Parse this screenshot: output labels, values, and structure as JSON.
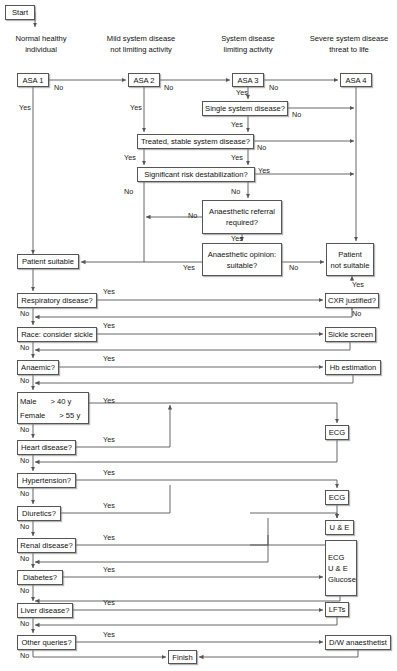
{
  "diagram": {
    "type": "flowchart",
    "canvas": {
      "width": 397,
      "height": 671
    },
    "style": {
      "box_border": "#555555",
      "box_fill": "#ffffff",
      "line": "#555555",
      "text": "#111111"
    }
  },
  "column_headers": [
    {
      "id": "h1",
      "lines": [
        "Normal healthy",
        "individual"
      ],
      "x": 5,
      "y": 33,
      "w": 72
    },
    {
      "id": "h2",
      "lines": [
        "Mild system disease",
        "not limiting activity"
      ],
      "x": 98,
      "y": 33,
      "w": 86
    },
    {
      "id": "h3",
      "lines": [
        "System disease",
        "limiting activity"
      ],
      "x": 212,
      "y": 33,
      "w": 72
    },
    {
      "id": "h4",
      "lines": [
        "Severe system disease",
        "threat to life"
      ],
      "x": 303,
      "y": 33,
      "w": 92
    }
  ],
  "nodes": [
    {
      "id": "start",
      "label": "Start",
      "x": 5,
      "y": 5,
      "w": 30,
      "h": 15
    },
    {
      "id": "asa1",
      "label": "ASA 1",
      "x": 17,
      "y": 73,
      "w": 32,
      "h": 14
    },
    {
      "id": "asa2",
      "label": "ASA 2",
      "x": 128,
      "y": 73,
      "w": 32,
      "h": 14
    },
    {
      "id": "asa3",
      "label": "ASA 3",
      "x": 232,
      "y": 73,
      "w": 32,
      "h": 14
    },
    {
      "id": "asa4",
      "label": "ASA 4",
      "x": 340,
      "y": 73,
      "w": 32,
      "h": 14
    },
    {
      "id": "single",
      "label": "Single system disease?",
      "x": 202,
      "y": 101,
      "w": 86,
      "h": 15
    },
    {
      "id": "treated",
      "label": "Treated, stable system disease?",
      "x": 137,
      "y": 134,
      "w": 117,
      "h": 15
    },
    {
      "id": "signif",
      "label": "Significant risk destabilization?",
      "x": 137,
      "y": 167,
      "w": 118,
      "h": 15
    },
    {
      "id": "referral",
      "lines": [
        "Anaesthetic referral",
        "required?"
      ],
      "x": 202,
      "y": 200,
      "w": 80,
      "h": 34
    },
    {
      "id": "opinion",
      "lines": [
        "Anaesthetic opinion:",
        "suitable?"
      ],
      "x": 202,
      "y": 243,
      "w": 80,
      "h": 33
    },
    {
      "id": "suitable",
      "label": "Patient suitable",
      "x": 17,
      "y": 254,
      "w": 62,
      "h": 15
    },
    {
      "id": "notsuitable",
      "lines": [
        "Patient",
        "not suitable"
      ],
      "x": 326,
      "y": 243,
      "w": 48,
      "h": 33
    },
    {
      "id": "resp",
      "label": "Respiratory disease?",
      "x": 17,
      "y": 293,
      "w": 80,
      "h": 15
    },
    {
      "id": "cxr",
      "label": "CXR justified?",
      "x": 325,
      "y": 293,
      "w": 54,
      "h": 15
    },
    {
      "id": "race",
      "label": "Race: consider sickle",
      "x": 17,
      "y": 327,
      "w": 80,
      "h": 15
    },
    {
      "id": "sickle",
      "label": "Sickle screen",
      "x": 325,
      "y": 327,
      "w": 51,
      "h": 15
    },
    {
      "id": "anaemic",
      "label": "Anaemic?",
      "x": 17,
      "y": 360,
      "w": 42,
      "h": 15
    },
    {
      "id": "hb",
      "label": "Hb estimation",
      "x": 325,
      "y": 360,
      "w": 56,
      "h": 15
    },
    {
      "id": "age",
      "rows": [
        [
          "Male",
          "> 40 y"
        ],
        [
          "Female",
          "> 55 y"
        ]
      ],
      "x": 17,
      "y": 392,
      "w": 72,
      "h": 32
    },
    {
      "id": "ecg1",
      "label": "ECG",
      "x": 325,
      "y": 425,
      "w": 24,
      "h": 15
    },
    {
      "id": "heart",
      "label": "Heart disease?",
      "x": 17,
      "y": 440,
      "w": 59,
      "h": 15
    },
    {
      "id": "hyper",
      "label": "Hypertension?",
      "x": 17,
      "y": 473,
      "w": 59,
      "h": 15
    },
    {
      "id": "ecg2",
      "label": "ECG",
      "x": 325,
      "y": 490,
      "w": 24,
      "h": 15
    },
    {
      "id": "diuretics",
      "label": "Diuretics?",
      "x": 17,
      "y": 506,
      "w": 44,
      "h": 15
    },
    {
      "id": "ue",
      "label": "U & E",
      "x": 325,
      "y": 520,
      "w": 29,
      "h": 15
    },
    {
      "id": "renal",
      "label": "Renal disease?",
      "x": 17,
      "y": 538,
      "w": 59,
      "h": 15
    },
    {
      "id": "diabpanel",
      "lines": [
        "ECG",
        "U & E",
        "Glucose"
      ],
      "x": 325,
      "y": 540,
      "w": 32,
      "h": 56,
      "align": "left"
    },
    {
      "id": "diabetes",
      "label": "Diabetes?",
      "x": 17,
      "y": 570,
      "w": 46,
      "h": 15
    },
    {
      "id": "liver",
      "label": "Liver disease?",
      "x": 17,
      "y": 603,
      "w": 56,
      "h": 15
    },
    {
      "id": "lfts",
      "label": "LFTs",
      "x": 325,
      "y": 602,
      "w": 24,
      "h": 15
    },
    {
      "id": "other",
      "label": "Other queries?",
      "x": 17,
      "y": 635,
      "w": 59,
      "h": 15
    },
    {
      "id": "dw",
      "label": "D/W anaesthetist",
      "x": 325,
      "y": 635,
      "w": 66,
      "h": 15
    },
    {
      "id": "finish",
      "label": "Finish",
      "x": 168,
      "y": 650,
      "w": 29,
      "h": 14
    }
  ],
  "edge_labels": [
    {
      "id": "e1",
      "text": "No",
      "x": 54,
      "y": 84
    },
    {
      "id": "e2",
      "text": "No",
      "x": 164,
      "y": 84
    },
    {
      "id": "e3",
      "text": "No",
      "x": 269,
      "y": 84
    },
    {
      "id": "e4",
      "text": "Yes",
      "x": 19,
      "y": 104
    },
    {
      "id": "e5",
      "text": "Yes",
      "x": 130,
      "y": 104
    },
    {
      "id": "e6",
      "text": "Yes",
      "x": 236,
      "y": 89
    },
    {
      "id": "e7",
      "text": "No",
      "x": 292,
      "y": 111
    },
    {
      "id": "e8",
      "text": "Yes",
      "x": 231,
      "y": 121
    },
    {
      "id": "e9",
      "text": "No",
      "x": 257,
      "y": 144
    },
    {
      "id": "e10",
      "text": "Yes",
      "x": 124,
      "y": 154
    },
    {
      "id": "e11",
      "text": "Yes",
      "x": 231,
      "y": 154
    },
    {
      "id": "e12",
      "text": "Yes",
      "x": 258,
      "y": 167
    },
    {
      "id": "e13",
      "text": "No",
      "x": 124,
      "y": 188
    },
    {
      "id": "e14",
      "text": "No",
      "x": 231,
      "y": 188
    },
    {
      "id": "e15",
      "text": "No",
      "x": 188,
      "y": 212
    },
    {
      "id": "e16",
      "text": "Yes",
      "x": 231,
      "y": 235
    },
    {
      "id": "e17",
      "text": "Yes",
      "x": 183,
      "y": 264
    },
    {
      "id": "e18",
      "text": "No",
      "x": 289,
      "y": 264
    },
    {
      "id": "e19",
      "text": "Yes",
      "x": 352,
      "y": 281
    },
    {
      "id": "e20",
      "text": "Yes",
      "x": 103,
      "y": 288
    },
    {
      "id": "e21",
      "text": "No",
      "x": 20,
      "y": 310
    },
    {
      "id": "e22",
      "text": "No",
      "x": 352,
      "y": 310
    },
    {
      "id": "e23",
      "text": "Yes",
      "x": 103,
      "y": 322
    },
    {
      "id": "e24",
      "text": "No",
      "x": 20,
      "y": 344
    },
    {
      "id": "e25",
      "text": "Yes",
      "x": 103,
      "y": 355
    },
    {
      "id": "e26",
      "text": "No",
      "x": 20,
      "y": 377
    },
    {
      "id": "e27",
      "text": "Yes",
      "x": 103,
      "y": 397
    },
    {
      "id": "e28",
      "text": "No",
      "x": 20,
      "y": 426
    },
    {
      "id": "e29",
      "text": "Yes",
      "x": 103,
      "y": 436
    },
    {
      "id": "e30",
      "text": "No",
      "x": 20,
      "y": 457
    },
    {
      "id": "e31",
      "text": "Yes",
      "x": 103,
      "y": 469
    },
    {
      "id": "e32",
      "text": "No",
      "x": 20,
      "y": 490
    },
    {
      "id": "e33",
      "text": "Yes",
      "x": 103,
      "y": 502
    },
    {
      "id": "e34",
      "text": "No",
      "x": 20,
      "y": 523
    },
    {
      "id": "e35",
      "text": "Yes",
      "x": 103,
      "y": 534
    },
    {
      "id": "e36",
      "text": "No",
      "x": 20,
      "y": 555
    },
    {
      "id": "e37",
      "text": "Yes",
      "x": 103,
      "y": 566
    },
    {
      "id": "e38",
      "text": "No",
      "x": 20,
      "y": 587
    },
    {
      "id": "e39",
      "text": "Yes",
      "x": 103,
      "y": 599
    },
    {
      "id": "e40",
      "text": "No",
      "x": 20,
      "y": 620
    },
    {
      "id": "e41",
      "text": "Yes",
      "x": 103,
      "y": 631
    },
    {
      "id": "e42",
      "text": "No",
      "x": 20,
      "y": 652
    }
  ],
  "edges": [
    {
      "id": "start-arrow",
      "d": "M 30 12 H 35 V 27",
      "arrow": "end"
    },
    {
      "id": "asa1-asa2",
      "d": "M 49 80 H 126",
      "arrow": "end"
    },
    {
      "id": "asa2-asa3",
      "d": "M 160 80 H 230",
      "arrow": "end"
    },
    {
      "id": "asa3-asa4",
      "d": "M 264 80 H 338",
      "arrow": "end"
    },
    {
      "id": "asa1-down",
      "d": "M 33 87 V 254",
      "arrow": "end"
    },
    {
      "id": "asa2-down",
      "d": "M 144 87 V 132",
      "arrow": "end"
    },
    {
      "id": "asa3-single",
      "d": "M 248 87 V 99",
      "arrow": "end"
    },
    {
      "id": "asa4-down",
      "d": "M 356 87 V 241",
      "arrow": "end"
    },
    {
      "id": "single-no",
      "d": "M 288 108 H 354",
      "arrow": "end"
    },
    {
      "id": "single-yes",
      "d": "M 248 116 V 132",
      "arrow": "end"
    },
    {
      "id": "treated-no",
      "d": "M 254 141 H 354",
      "arrow": "end"
    },
    {
      "id": "treated-yesL",
      "d": "M 144 149 V 165",
      "arrow": "end"
    },
    {
      "id": "treated-yesR",
      "d": "M 248 149 V 165",
      "arrow": "end"
    },
    {
      "id": "signif-yes",
      "d": "M 255 174 H 354",
      "arrow": "end"
    },
    {
      "id": "signif-noL",
      "d": "M 144 182 V 262",
      "arrow": "none"
    },
    {
      "id": "signif-noR",
      "d": "M 248 182 V 198",
      "arrow": "end"
    },
    {
      "id": "referral-no",
      "d": "M 202 217 H 146",
      "arrow": "end"
    },
    {
      "id": "referral-yes",
      "d": "M 242 234 V 241",
      "arrow": "end"
    },
    {
      "id": "opinion-yes",
      "d": "M 202 262 H 81",
      "arrow": "end"
    },
    {
      "id": "opinion-no",
      "d": "M 282 262 H 324",
      "arrow": "end"
    },
    {
      "id": "suit-down",
      "d": "M 33 269 V 291",
      "arrow": "end"
    },
    {
      "id": "resp-yes",
      "d": "M 97 300 H 323",
      "arrow": "end"
    },
    {
      "id": "cxr-yes",
      "d": "M 352 310 V 293",
      "arrow": "none"
    },
    {
      "id": "cxr-up",
      "d": "M 352 281 V 276",
      "arrow": "end"
    },
    {
      "id": "cxr-no",
      "d": "M 352 308 V 317 H 35",
      "arrow": "end"
    },
    {
      "id": "resp-no",
      "d": "M 33 308 V 325",
      "arrow": "end"
    },
    {
      "id": "race-yes",
      "d": "M 97 334 H 323",
      "arrow": "end"
    },
    {
      "id": "sickle-no",
      "d": "M 350 342 V 350 H 35",
      "arrow": "end"
    },
    {
      "id": "race-no",
      "d": "M 33 342 V 358",
      "arrow": "end"
    },
    {
      "id": "anaemic-yes",
      "d": "M 59 367 H 323",
      "arrow": "end"
    },
    {
      "id": "hb-no",
      "d": "M 353 375 V 383 H 35",
      "arrow": "end"
    },
    {
      "id": "anaemic-no",
      "d": "M 33 375 V 390",
      "arrow": "end"
    },
    {
      "id": "age-yes",
      "d": "M 89 403 H 337 V 423",
      "arrow": "end"
    },
    {
      "id": "age-no",
      "d": "M 33 424 V 438",
      "arrow": "end"
    },
    {
      "id": "heart-yes",
      "d": "M 76 447 H 170 V 405",
      "arrow": "end"
    },
    {
      "id": "ecg1-no",
      "d": "M 337 440 V 462 H 35",
      "arrow": "end"
    },
    {
      "id": "heart-no",
      "d": "M 33 455 V 471",
      "arrow": "end"
    },
    {
      "id": "hyper-yes",
      "d": "M 76 480 H 337 V 488",
      "arrow": "end"
    },
    {
      "id": "hyper-no",
      "d": "M 33 488 V 504",
      "arrow": "end"
    },
    {
      "id": "diur-yes",
      "d": "M 61 513 H 170 V 485",
      "arrow": "none"
    },
    {
      "id": "diur-ue",
      "d": "M 250 513 H 337 V 518",
      "arrow": "end"
    },
    {
      "id": "ecg2-ue",
      "d": "M 337 505 V 518",
      "arrow": "end"
    },
    {
      "id": "diur-no",
      "d": "M 33 521 V 536",
      "arrow": "end"
    },
    {
      "id": "renal-yes",
      "d": "M 76 545 H 268 V 518",
      "arrow": "none"
    },
    {
      "id": "renal-yes2",
      "d": "M 250 545 H 337",
      "arrow": "none"
    },
    {
      "id": "ue-back",
      "d": "M 268 535 V 562 H 35",
      "arrow": "end"
    },
    {
      "id": "renal-no",
      "d": "M 33 553 V 568",
      "arrow": "end"
    },
    {
      "id": "diab-yes",
      "d": "M 63 577 H 323",
      "arrow": "end"
    },
    {
      "id": "diabp-no",
      "d": "M 340 596 V 601 H 35",
      "arrow": "end"
    },
    {
      "id": "diab-no",
      "d": "M 33 585 V 601",
      "arrow": "end"
    },
    {
      "id": "liver-yes",
      "d": "M 73 610 H 323",
      "arrow": "end"
    },
    {
      "id": "lfts-no",
      "d": "M 337 617 V 625 H 35",
      "arrow": "end"
    },
    {
      "id": "liver-no",
      "d": "M 33 618 V 633",
      "arrow": "end"
    },
    {
      "id": "other-yes",
      "d": "M 76 642 H 323",
      "arrow": "end"
    },
    {
      "id": "other-no",
      "d": "M 33 650 V 657 H 166",
      "arrow": "end"
    },
    {
      "id": "dw-finish",
      "d": "M 358 650 V 657 H 199",
      "arrow": "end"
    }
  ]
}
